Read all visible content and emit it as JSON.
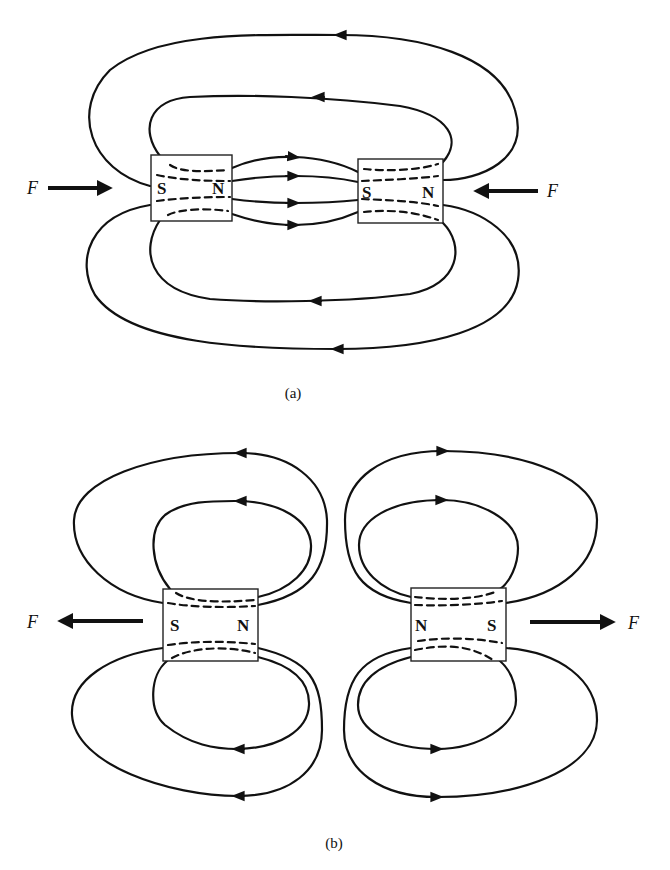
{
  "figure": {
    "panel_a": {
      "caption": "(a)",
      "description": "Opposite poles facing: attraction",
      "left_magnet": {
        "left_pole": "S",
        "right_pole": "N"
      },
      "right_magnet": {
        "left_pole": "S",
        "right_pole": "N"
      },
      "force_left": {
        "label": "F",
        "direction": "right"
      },
      "force_right": {
        "label": "F",
        "direction": "left"
      }
    },
    "panel_b": {
      "caption": "(b)",
      "description": "Like poles facing: repulsion",
      "left_magnet": {
        "left_pole": "S",
        "right_pole": "N"
      },
      "right_magnet": {
        "left_pole": "N",
        "right_pole": "S"
      },
      "force_left": {
        "label": "F",
        "direction": "left"
      },
      "force_right": {
        "label": "F",
        "direction": "right"
      }
    },
    "colors": {
      "ink": "#111111",
      "background": "#ffffff"
    }
  }
}
